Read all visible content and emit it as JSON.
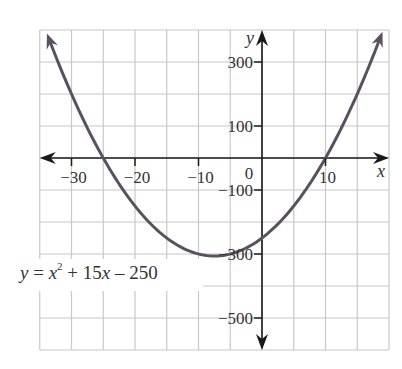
{
  "chart_data": {
    "type": "line",
    "title": "",
    "equation": "y = x^2 + 15x - 250",
    "coefficients": {
      "a": 1,
      "b": 15,
      "c": -250
    },
    "xlabel": "x",
    "ylabel": "y",
    "xlim": [
      -35,
      20
    ],
    "ylim": [
      -600,
      400
    ],
    "grid": true,
    "grid_x_step": 5,
    "grid_y_step": 100,
    "x_ticks": [
      -30,
      -20,
      -10,
      0,
      10
    ],
    "x_tick_labels": [
      "−30",
      "−20",
      "−10",
      "0",
      "10"
    ],
    "y_ticks": [
      300,
      100,
      -100,
      -300,
      -500
    ],
    "y_tick_labels": [
      "300",
      "100",
      "−100",
      "−300",
      "−500"
    ],
    "series": [
      {
        "name": "y = x^2 + 15x - 250",
        "x": [
          -34.07,
          -30,
          -25,
          -20,
          -15,
          -10,
          -7.5,
          -5,
          0,
          5,
          10,
          15,
          19.07
        ],
        "values": [
          400,
          200,
          0,
          -150,
          -250,
          -300,
          -306.25,
          -300,
          -250,
          -150,
          0,
          200,
          400
        ],
        "color": "#5b5060"
      }
    ],
    "x_intercepts": [
      -25,
      10
    ],
    "y_intercept": -250,
    "vertex": [
      -7.5,
      -306.25
    ]
  },
  "labels": {
    "x_axis": "x",
    "y_axis": "y",
    "origin": "0",
    "eq_y": "y",
    "eq_eq": " = ",
    "eq_x": "x",
    "eq_sup": "2",
    "eq_rest_a": " + 15",
    "eq_x2": "x",
    "eq_rest_b": " – 250"
  },
  "colors": {
    "grid": "#c8c8c8",
    "axis": "#1a1a1a",
    "curve": "#5b5060",
    "text": "#333333"
  }
}
